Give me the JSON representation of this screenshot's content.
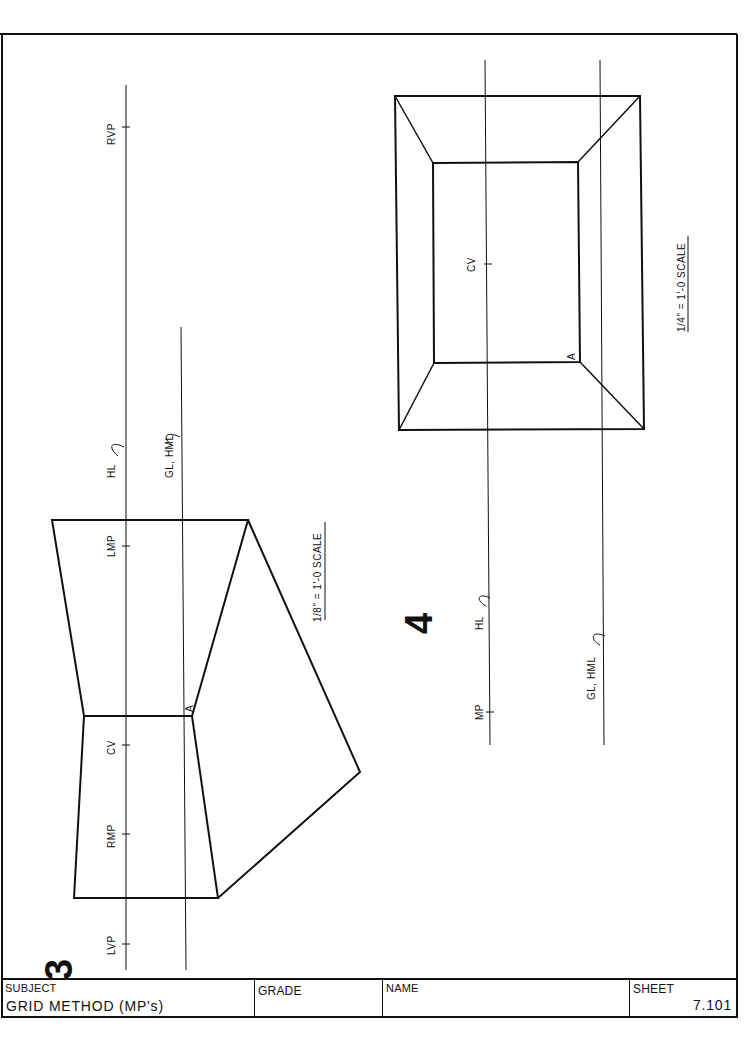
{
  "sheet": {
    "title_block": {
      "subject_label": "SUBJECT",
      "subject_value": "GRID METHOD  (MP's)",
      "grade_label": "GRADE",
      "grade_value": "",
      "name_label": "NAME",
      "name_value": "",
      "sheet_label": "SHEET",
      "sheet_value": "7.101"
    }
  },
  "problem3": {
    "number": "3",
    "scale": "1/8\" = 1'-0  SCALE",
    "labels": {
      "rvp": "RVP",
      "hl": "HL",
      "gl_hml": "GL, HML",
      "lmp": "LMP",
      "cv": "CV",
      "rmp": "RMP",
      "lvp": "LVP",
      "point_a": "A"
    }
  },
  "problem4": {
    "number": "4",
    "scale": "1/4\" = 1'-0  SCALE",
    "labels": {
      "cv": "CV",
      "hl": "HL",
      "mp": "MP",
      "gl_hml": "GL, HML",
      "point_a": "A"
    }
  }
}
